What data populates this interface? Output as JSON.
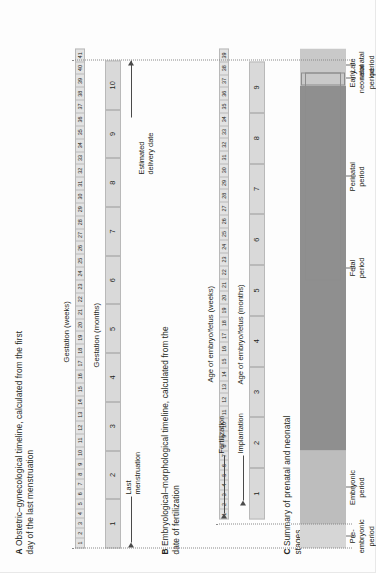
{
  "figure": {
    "type": "timeline-diagram",
    "title_hidden": "Prenatal and neonatal timelines"
  },
  "panels": [
    {
      "letter": "A",
      "title": "Obstetric–gynecological timeline, calculated from the first day of the last menstruation",
      "week_axis_label": "Gestation (weeks)",
      "month_axis_label": "Gestation (months)",
      "weeks": [
        "1",
        "2",
        "3",
        "4",
        "5",
        "6",
        "7",
        "8",
        "9",
        "10",
        "11",
        "12",
        "13",
        "14",
        "15",
        "16",
        "17",
        "18",
        "19",
        "20",
        "21",
        "22",
        "23",
        "24",
        "25",
        "26",
        "27",
        "28",
        "29",
        "30",
        "31",
        "32",
        "33",
        "34",
        "35",
        "36",
        "37",
        "38",
        "39",
        "40",
        "41"
      ],
      "months": [
        "1",
        "2",
        "3",
        "4",
        "5",
        "6",
        "7",
        "8",
        "9",
        "10"
      ],
      "week_count": 41,
      "month_count": 10
    },
    {
      "letter": "B",
      "title": "Embryological–morphological timeline, calculated from the date of fertilization",
      "week_axis_label": "Age of embryo/fetus (weeks)",
      "month_axis_label": "Age of embryo/fetus (months)",
      "weeks": [
        "1",
        "2",
        "3",
        "4",
        "5",
        "6",
        "7",
        "8",
        "9",
        "10",
        "11",
        "12",
        "13",
        "14",
        "15",
        "16",
        "17",
        "18",
        "19",
        "20",
        "21",
        "22",
        "23",
        "24",
        "25",
        "26",
        "27",
        "28",
        "29",
        "30",
        "31",
        "32",
        "33",
        "34",
        "35",
        "36",
        "37",
        "38",
        "39"
      ],
      "months": [
        "1",
        "2",
        "3",
        "4",
        "5",
        "6",
        "7",
        "8",
        "9"
      ],
      "week_count": 39,
      "month_count": 9
    },
    {
      "letter": "C",
      "title": "Summary of prenatal and neonatal stages",
      "segments": [
        {
          "name": "pre-embryonic",
          "label": "Pre-\nembryonic\nperiod",
          "color": "#d6d6d6",
          "start_week": 0,
          "end_week": 2
        },
        {
          "name": "embryonic",
          "label": "Embryonic\nperiod",
          "color": "#bdbdbd",
          "start_week": 2,
          "end_week": 8
        },
        {
          "name": "fetal",
          "label": "Fetal\nperiod",
          "color": "#8f8f8f",
          "start_week": 8,
          "end_week": 38
        },
        {
          "name": "late-neonatal",
          "label": "Late\nneonatal\nperiod",
          "color": "#c9c9c9",
          "start_week": 38,
          "end_week": 41
        }
      ],
      "overlays": [
        {
          "name": "perinatal",
          "label": "Perinatal\nperiod",
          "start_week": 22,
          "end_week": 39
        },
        {
          "name": "early-neonatal",
          "label": "Early\nneonatal\nperiod",
          "start_week": 38,
          "end_week": 39
        }
      ]
    }
  ],
  "annotations": {
    "last_menstruation": "Last\nmenstruation",
    "fertilization": "Fertilization",
    "implantation": "Implantation",
    "estimated_delivery_date": "Estimated\ndelivery date"
  },
  "colors": {
    "strip_week_fill": "#e3e3e3",
    "strip_month_fill": "#d9d9d9",
    "strip_border": "#b9b9b9",
    "text": "#231f20",
    "leader": "#6e6e6e",
    "dotted": "#8a8a8a"
  }
}
